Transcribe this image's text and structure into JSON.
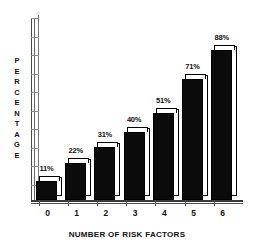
{
  "chart_data": {
    "type": "bar",
    "title": "",
    "subtitle": "",
    "categories": [
      "0",
      "1",
      "2",
      "3",
      "4",
      "5",
      "6"
    ],
    "values": [
      11,
      22,
      31,
      40,
      51,
      71,
      88
    ],
    "data_labels": [
      "11%",
      "22%",
      "31%",
      "40%",
      "51%",
      "71%",
      "88%"
    ],
    "xlabel": "NUMBER OF RISK FACTORS",
    "ylabel": "PERCENTAGE",
    "ylabel_letters": [
      "P",
      "E",
      "R",
      "C",
      "E",
      "N",
      "T",
      "A",
      "G",
      "E"
    ],
    "ylim": [
      0,
      100
    ],
    "ytick_count": 10,
    "ytick_labels": [],
    "grid": false,
    "legend": null,
    "style": "3d-bars",
    "colors": {
      "bar_front": "#0b0b0b",
      "bar_top": "#ffffff",
      "bar_side": "#ffffff",
      "outline": "#000000",
      "axis": "#555555",
      "text": "#111111",
      "background": "#ffffff"
    }
  }
}
